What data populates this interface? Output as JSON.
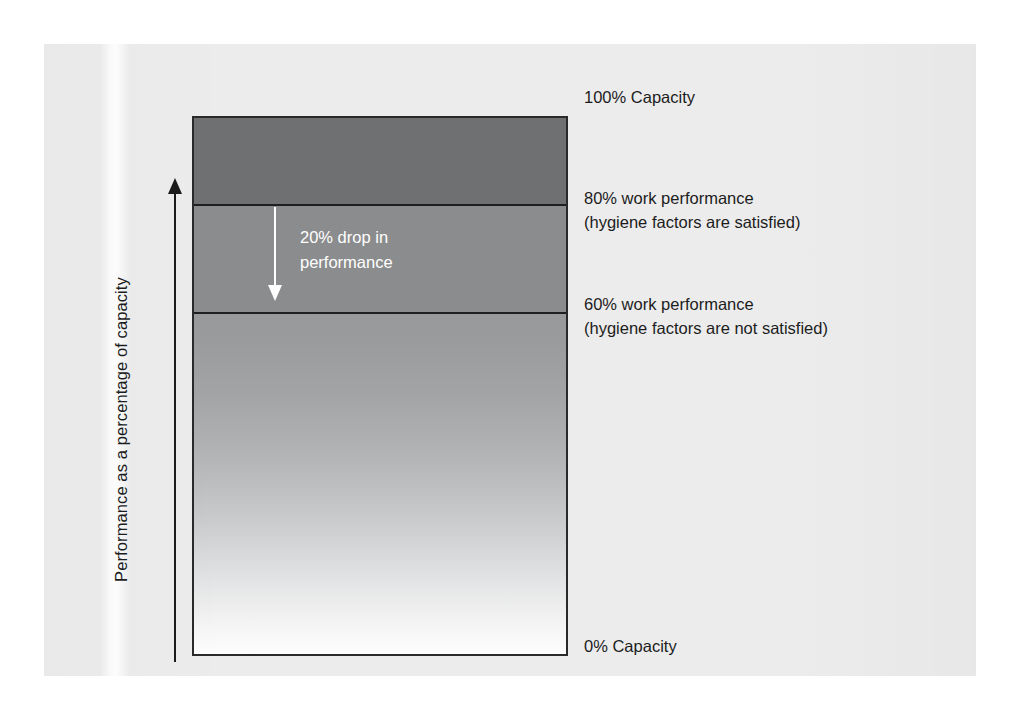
{
  "figure": {
    "axis": {
      "label": "Performance as a percentage of capacity",
      "arrow": "up-arrow"
    },
    "in_bar_annotation": {
      "line1": "20% drop in",
      "line2": "performance",
      "arrow": "down-arrow"
    },
    "callouts": [
      {
        "name": "top",
        "line1": "100% Capacity",
        "line2": ""
      },
      {
        "name": "eighty",
        "line1": "80% work performance",
        "line2": "(hygiene factors are satisfied)"
      },
      {
        "name": "sixty",
        "line1": "60% work performance",
        "line2": "(hygiene factors are not satisfied)"
      },
      {
        "name": "zero",
        "line1": "0% Capacity",
        "line2": ""
      }
    ]
  },
  "chart_data": {
    "type": "bar",
    "title": "",
    "xlabel": "",
    "ylabel": "Performance as a percentage of capacity",
    "ylim": [
      0,
      100
    ],
    "grid": false,
    "legend": "none",
    "orientation": "vertical-stacked-single-column",
    "categories": [
      "Capacity"
    ],
    "segments": [
      {
        "name": "Unused capacity above hygiene-satisfied performance",
        "from": 80,
        "to": 100,
        "value": 20,
        "fill": "#6f7071",
        "style": "solid-dark"
      },
      {
        "name": "20% drop in performance",
        "from": 60,
        "to": 80,
        "value": 20,
        "fill": "#8b8c8d",
        "style": "solid-medium"
      },
      {
        "name": "Performance when hygiene factors are not satisfied",
        "from": 0,
        "to": 60,
        "value": 60,
        "fill": "gradient",
        "style": "gradient-grey-to-white"
      }
    ],
    "annotations": [
      {
        "at": 100,
        "text": "100% Capacity"
      },
      {
        "at": 80,
        "text": "80% work performance (hygiene factors are satisfied)"
      },
      {
        "at": 60,
        "text": "60% work performance (hygiene factors are not satisfied)"
      },
      {
        "at": 0,
        "text": "0% Capacity"
      },
      {
        "from": 80,
        "to": 60,
        "text": "20% drop in performance"
      }
    ],
    "colors": {
      "paper": "#ececed",
      "band_top": "#6f7071",
      "band_mid": "#8b8c8d",
      "band_bottom_top": "#98999a",
      "band_bottom_base": "#fdfdfd",
      "outline": "#2a2a2a",
      "text": "#1c1c1c",
      "annotation_text": "#ffffff"
    }
  }
}
